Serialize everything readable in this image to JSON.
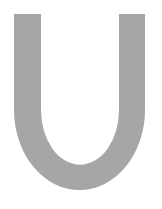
{
  "glyph": {
    "character": "U",
    "fill_color": "#a6a6a6",
    "background_color": "#ffffff"
  }
}
